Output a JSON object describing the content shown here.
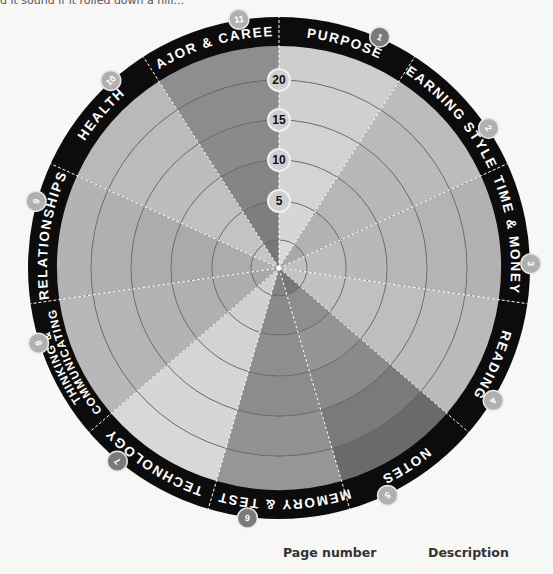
{
  "page": {
    "clipped_text": "d it sound if it rolled down a hill...",
    "footer": {
      "page_number_label": "Page number",
      "description_label": "Description"
    }
  },
  "colors": {
    "rim": "#0c0c0c",
    "ring_line": "#6e6e6e",
    "divider": "#ffffff",
    "background": "#f7f7f5",
    "badge_light": "#b0b0b0",
    "badge_dark": "#7a7a7a"
  },
  "chart_data": {
    "type": "radial-wheel",
    "title": "",
    "scale": {
      "ticks": [
        5,
        10,
        15,
        20
      ],
      "min": 0,
      "max": 25,
      "grid": true
    },
    "segments": [
      {
        "number": "1",
        "label": "PURPOSE",
        "badge": "dark",
        "shades": [
          "#dadada",
          "#d6d6d6",
          "#d4d4d4",
          "#d2d2d2",
          "#d0d0d0",
          "#cecece"
        ]
      },
      {
        "number": "2",
        "label": "LEARNING STYLES",
        "badge": "light",
        "shades": [
          "#a9a9a9",
          "#b2b2b2",
          "#b6b6b6",
          "#b8b8b8",
          "#bababa",
          "#bcbcbc"
        ]
      },
      {
        "number": "3",
        "label": "TIME & MONEY",
        "badge": "light",
        "shades": [
          "#c0c0c0",
          "#bcbcbc",
          "#b8b8b8",
          "#b6b6b6",
          "#b4b4b4",
          "#b2b2b2"
        ]
      },
      {
        "number": "4",
        "label": "READING",
        "badge": "light",
        "shades": [
          "#c4c4c4",
          "#c2c2c2",
          "#c0c0c0",
          "#bebebe",
          "#bcbcbc",
          "#bababa"
        ]
      },
      {
        "number": "5",
        "label": "NOTES",
        "badge": "light",
        "shades": [
          "#777777",
          "#8e8e8e",
          "#959595",
          "#8a8a8a",
          "#7a7a7a",
          "#6a6a6a"
        ]
      },
      {
        "number": "6",
        "label": "MEMORY & TESTS",
        "badge": "dark",
        "shades": [
          "#838383",
          "#8a8a8a",
          "#8e8e8e",
          "#8c8c8c",
          "#929292",
          "#969696"
        ]
      },
      {
        "number": "7",
        "label": "TECHNOLOGY",
        "badge": "dark",
        "shades": [
          "#cfcfcf",
          "#d1d1d1",
          "#d3d3d3",
          "#d5d5d5",
          "#d6d6d6",
          "#d8d8d8"
        ]
      },
      {
        "number": "8",
        "label": [
          "THINKING &",
          "COMMUNICATING"
        ],
        "badge": "light",
        "shades": [
          "#a8a8a8",
          "#adadad",
          "#b0b0b0",
          "#b3b3b3",
          "#b5b5b5",
          "#b8b8b8"
        ]
      },
      {
        "number": "9",
        "label": "RELATIONSHIPS",
        "badge": "light",
        "shades": [
          "#b0b0b0",
          "#acacac",
          "#aaaaaa",
          "#adadad",
          "#b0b0b0",
          "#b3b3b3"
        ]
      },
      {
        "number": "10",
        "label": "HEALTH",
        "badge": "light",
        "shades": [
          "#c6c6c6",
          "#c3c3c3",
          "#c0c0c0",
          "#bdbdbd",
          "#bbbbbb",
          "#b9b9b9"
        ]
      },
      {
        "number": "11",
        "label": "MAJOR & CAREER",
        "badge": "light",
        "shades": [
          "#777777",
          "#7e7e7e",
          "#858585",
          "#8a8a8a",
          "#8c8c8c",
          "#8e8e8e"
        ]
      }
    ]
  }
}
